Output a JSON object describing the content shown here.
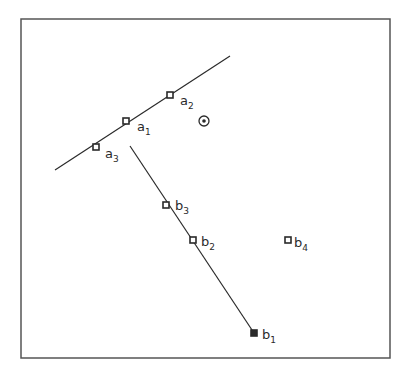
{
  "diagram": {
    "frame": {
      "x1": 21,
      "y1": 19,
      "x2": 390,
      "y2": 358,
      "stroke": "#555555"
    },
    "lines": [
      {
        "id": "line-a",
        "x1": 55,
        "y1": 170,
        "x2": 230,
        "y2": 56
      },
      {
        "id": "line-b",
        "x1": 130,
        "y1": 146,
        "x2": 254,
        "y2": 333
      }
    ],
    "points": [
      {
        "id": "a1",
        "base": "a",
        "sub": "1",
        "x": 126,
        "y": 121,
        "lx": 137,
        "ly": 131,
        "filled": false
      },
      {
        "id": "a2",
        "base": "a",
        "sub": "2",
        "x": 170,
        "y": 95,
        "lx": 180,
        "ly": 105,
        "filled": false
      },
      {
        "id": "a3",
        "base": "a",
        "sub": "3",
        "x": 96,
        "y": 147,
        "lx": 105,
        "ly": 158,
        "filled": false
      },
      {
        "id": "b1",
        "base": "b",
        "sub": "1",
        "x": 254,
        "y": 333,
        "lx": 262,
        "ly": 339,
        "filled": true
      },
      {
        "id": "b2",
        "base": "b",
        "sub": "2",
        "x": 193,
        "y": 240,
        "lx": 201,
        "ly": 246,
        "filled": false
      },
      {
        "id": "b3",
        "base": "b",
        "sub": "3",
        "x": 166,
        "y": 205,
        "lx": 175,
        "ly": 210,
        "filled": false
      },
      {
        "id": "b4",
        "base": "b",
        "sub": "4",
        "x": 288,
        "y": 240,
        "lx": 294,
        "ly": 247,
        "filled": false
      }
    ],
    "center_marker": {
      "x": 204,
      "y": 121,
      "r": 5
    },
    "colors": {
      "ink": "#2a2a2a",
      "background": "#ffffff"
    }
  }
}
